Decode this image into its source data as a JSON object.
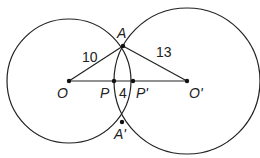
{
  "diagram": {
    "type": "intersecting-circles",
    "circles": [
      {
        "center": "O",
        "radius_label": "10"
      },
      {
        "center": "O'",
        "radius_label": "13"
      }
    ],
    "points": {
      "A": "A",
      "A_prime": "A'",
      "O": "O",
      "O_prime": "O'",
      "P": "P",
      "P_prime": "P'"
    },
    "segment_labels": {
      "OA": "10",
      "O_prime_A": "13",
      "PP_prime": "4"
    },
    "colors": {
      "stroke": "#222222",
      "background": "#ffffff"
    }
  }
}
